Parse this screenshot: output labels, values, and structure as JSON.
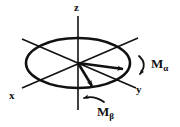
{
  "figure": {
    "name": "magnetization-vector-diagram",
    "background_color": "#ffffff",
    "ink_color": "#111111",
    "axes": {
      "z": {
        "label": "z"
      },
      "x": {
        "label": "x"
      },
      "y": {
        "label": "y"
      }
    },
    "vectors": [
      {
        "id": "m-alpha",
        "label_base": "M",
        "label_subscript": "α",
        "description": "magnetization vector alpha pointing toward y"
      },
      {
        "id": "m-beta",
        "label_base": "M",
        "label_subscript": "β",
        "description": "magnetization vector beta pointing down-right"
      }
    ],
    "precession_arcs": [
      {
        "id": "arc-alpha",
        "near": "m-alpha"
      },
      {
        "id": "arc-beta",
        "near": "m-beta"
      }
    ]
  }
}
